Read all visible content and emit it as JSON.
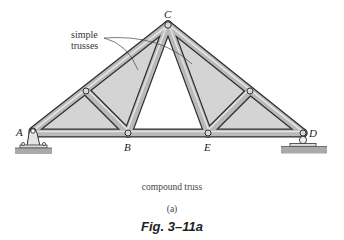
{
  "figure": {
    "title": "Fig. 3–11a",
    "subcaption": "(a)",
    "caption": "compound truss"
  },
  "annotation": {
    "line1": "simple",
    "line2": "trusses"
  },
  "joints": {
    "A": "A",
    "B": "B",
    "C": "C",
    "D": "D",
    "E": "E"
  },
  "colors": {
    "member": "#b8b8b8",
    "member_edge": "#333333",
    "panel_fill": "#cfcfcf",
    "ground": "#a8a8a8"
  }
}
